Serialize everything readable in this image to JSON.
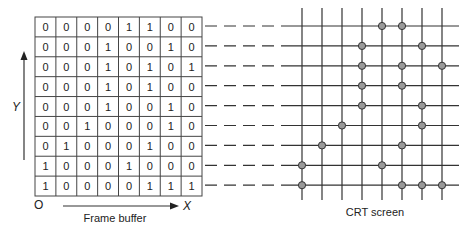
{
  "frame_buffer": {
    "label": "Frame buffer",
    "origin_label": "O",
    "x_axis_label": "X",
    "y_axis_label": "Y",
    "rows": [
      [
        0,
        0,
        0,
        0,
        1,
        1,
        0,
        0
      ],
      [
        0,
        0,
        0,
        1,
        0,
        0,
        1,
        0
      ],
      [
        0,
        0,
        0,
        1,
        0,
        1,
        0,
        1
      ],
      [
        0,
        0,
        0,
        1,
        0,
        1,
        0,
        0
      ],
      [
        0,
        0,
        0,
        1,
        0,
        0,
        1,
        0
      ],
      [
        0,
        0,
        1,
        0,
        0,
        0,
        1,
        0
      ],
      [
        0,
        1,
        0,
        0,
        0,
        1,
        0,
        0
      ],
      [
        1,
        0,
        0,
        0,
        1,
        0,
        0,
        0
      ],
      [
        1,
        0,
        0,
        0,
        0,
        1,
        1,
        1
      ]
    ]
  },
  "crt_screen": {
    "label": "CRT screen",
    "columns": 8,
    "rows": 9
  },
  "colors": {
    "line": "#333333",
    "grid_line": "#444444",
    "pixel_fill": "#9a9a9a",
    "pixel_stroke": "#333333",
    "text": "#222222"
  }
}
